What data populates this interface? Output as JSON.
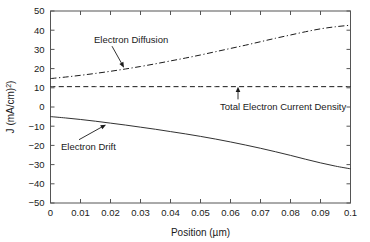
{
  "chart_data": {
    "type": "line",
    "title": "",
    "xlabel": "Position (µm)",
    "ylabel": "J (mA/cm²)",
    "xlim": [
      0,
      0.1
    ],
    "ylim": [
      -50,
      50
    ],
    "grid": false,
    "legend_position": "none",
    "xticks": [
      "0",
      "0.01",
      "0.02",
      "0.03",
      "0.04",
      "0.05",
      "0.06",
      "0.07",
      "0.08",
      "0.09",
      "0.1"
    ],
    "xtick_values": [
      0,
      0.01,
      0.02,
      0.03,
      0.04,
      0.05,
      0.06,
      0.07,
      0.08,
      0.09,
      0.1
    ],
    "yticks": [
      "50",
      "40",
      "30",
      "20",
      "10",
      "0",
      "−10",
      "−20",
      "−30",
      "−40",
      "−50"
    ],
    "ytick_values": [
      50,
      40,
      30,
      20,
      10,
      0,
      -10,
      -20,
      -30,
      -40,
      -50
    ],
    "x": [
      0,
      0.005,
      0.01,
      0.015,
      0.02,
      0.025,
      0.03,
      0.035,
      0.04,
      0.045,
      0.05,
      0.055,
      0.06,
      0.065,
      0.07,
      0.075,
      0.08,
      0.085,
      0.09,
      0.095,
      0.1
    ],
    "series": [
      {
        "name": "Electron Diffusion",
        "style": "dashdot",
        "values": [
          14.8,
          15.6,
          16.5,
          17.5,
          18.6,
          19.8,
          21.1,
          22.5,
          24.0,
          25.5,
          27.1,
          28.8,
          30.5,
          32.2,
          34.0,
          35.8,
          37.5,
          39.2,
          40.7,
          41.8,
          42.6
        ]
      },
      {
        "name": "Total Electron Current Density",
        "style": "dashed",
        "values": [
          10.6,
          10.6,
          10.6,
          10.6,
          10.6,
          10.6,
          10.6,
          10.6,
          10.6,
          10.6,
          10.6,
          10.6,
          10.6,
          10.6,
          10.6,
          10.6,
          10.6,
          10.6,
          10.6,
          10.6,
          10.6
        ]
      },
      {
        "name": "Electron Drift",
        "style": "solid",
        "values": [
          -5.0,
          -5.7,
          -6.5,
          -7.4,
          -8.4,
          -9.4,
          -10.5,
          -11.6,
          -12.8,
          -14.0,
          -15.3,
          -16.7,
          -18.2,
          -19.8,
          -21.5,
          -23.3,
          -25.2,
          -27.2,
          -29.1,
          -30.8,
          -32.2
        ]
      }
    ],
    "annotations": [
      {
        "text": "Electron Diffusion",
        "label_x": 0.0145,
        "label_y": 33.5,
        "point_x": 0.0245,
        "point_y": 20.5
      },
      {
        "text": "Total Electron Current Density",
        "label_x": 0.0565,
        "label_y": -1.5,
        "point_x": 0.0625,
        "point_y": 10.6
      },
      {
        "text": "Electron Drift",
        "label_x": 0.0035,
        "label_y": -22.5,
        "point_x": 0.0185,
        "point_y": -9.2
      }
    ]
  }
}
